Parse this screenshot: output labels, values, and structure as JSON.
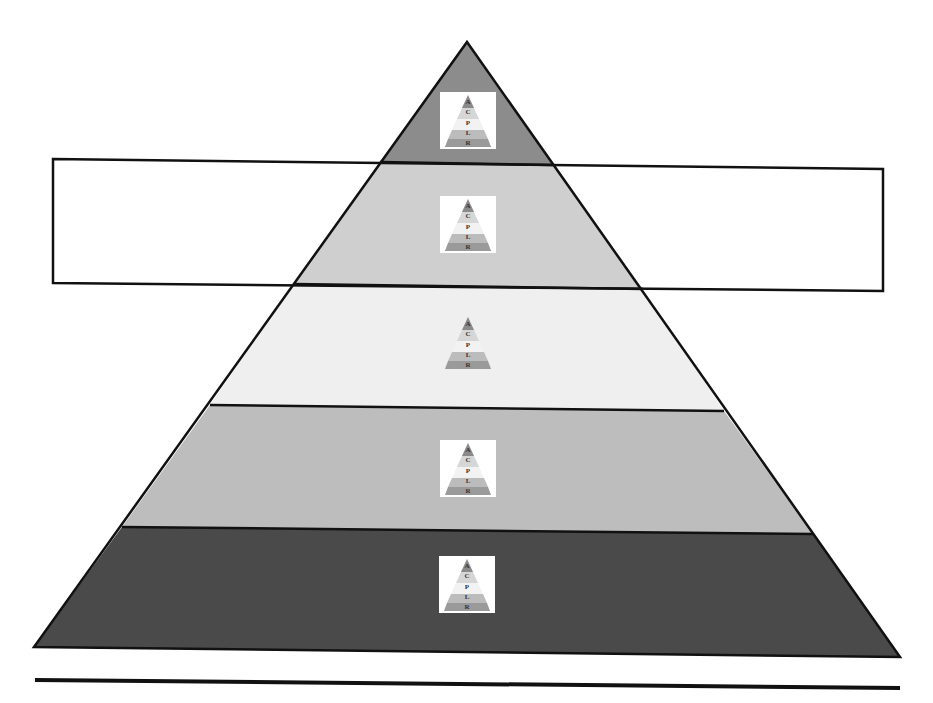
{
  "diagram": {
    "type": "pyramid",
    "levels": [
      {
        "index": 1,
        "position": "top",
        "fill": "#8c8c8c",
        "icon": "mini-pyramid-icon"
      },
      {
        "index": 2,
        "position": "second",
        "fill": "#cfcfcf",
        "icon": "mini-pyramid-icon"
      },
      {
        "index": 3,
        "position": "third",
        "fill": "#efefef",
        "icon": "mini-pyramid-icon"
      },
      {
        "index": 4,
        "position": "fourth",
        "fill": "#bdbdbd",
        "icon": "mini-pyramid-icon"
      },
      {
        "index": 5,
        "position": "bottom",
        "fill": "#4a4a4a",
        "icon": "mini-pyramid-icon"
      }
    ],
    "icon_letters": [
      "A",
      "C",
      "P",
      "L",
      "R"
    ],
    "highlight_box": {
      "target_level": 2,
      "fill": "none",
      "stroke": "#111111"
    },
    "outline_color": "#111111",
    "rule_color": "#111111"
  }
}
